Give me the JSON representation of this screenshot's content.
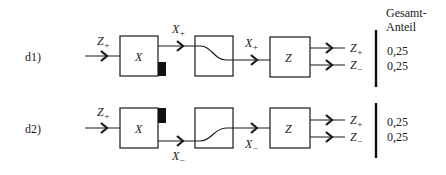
{
  "header": {
    "column_title_line1": "Gesamt-",
    "column_title_line2": "Anteil"
  },
  "rows": [
    {
      "label": "d1)",
      "input": {
        "var": "Z",
        "sign": "+"
      },
      "block1": {
        "label": "X",
        "marker_position": "bottom-right"
      },
      "block1_output": {
        "var": "X",
        "sign": "+"
      },
      "block2": {
        "label": "",
        "curve": "falling"
      },
      "block2_output": {
        "var": "X",
        "sign": "+"
      },
      "block3": {
        "label": "Z"
      },
      "outputs": [
        {
          "var": "Z",
          "sign": "+",
          "share": "0,25"
        },
        {
          "var": "Z",
          "sign": "−",
          "share": "0,25"
        }
      ]
    },
    {
      "label": "d2)",
      "input": {
        "var": "Z",
        "sign": "+"
      },
      "block1": {
        "label": "X",
        "marker_position": "top-right"
      },
      "block1_output": {
        "var": "X",
        "sign": "−"
      },
      "block2": {
        "label": "",
        "curve": "rising"
      },
      "block2_output": {
        "var": "X",
        "sign": "−"
      },
      "block3": {
        "label": "Z"
      },
      "outputs": [
        {
          "var": "Z",
          "sign": "+",
          "share": "0,25"
        },
        {
          "var": "Z",
          "sign": "−",
          "share": "0,25"
        }
      ]
    }
  ]
}
